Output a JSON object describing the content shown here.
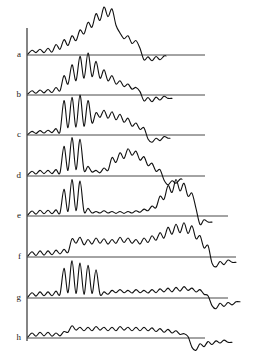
{
  "figure": {
    "kind": "stacked-spectra",
    "background_color": "#ffffff",
    "line_color": "#101010",
    "axis_color": "#333333",
    "line_width": 1.1,
    "width": 272,
    "height": 359,
    "axis": {
      "name": "vertical-axis",
      "x": 27,
      "y_top": 28,
      "y_bottom": 341
    }
  },
  "chart_data": {
    "type": "line",
    "title": "",
    "subtitle": "",
    "xlabel": "",
    "ylabel": "",
    "grid": false,
    "legend_position": "left-labels",
    "axis_ranges": {
      "x": [
        0,
        250
      ],
      "y": [
        0,
        359
      ]
    },
    "series_labels": [
      "a",
      "b",
      "c",
      "d",
      "e",
      "f",
      "g",
      "h"
    ],
    "series": [
      {
        "name": "a",
        "label": "a",
        "baseline_y": 55,
        "baseline_x_start": 27,
        "baseline_x_end": 205,
        "tail_x_end": 166,
        "amplitude_scale": 48,
        "x": [
          28,
          32,
          36,
          40,
          44,
          48,
          52,
          56,
          60,
          64,
          68,
          72,
          76,
          80,
          84,
          88,
          92,
          96,
          100,
          104,
          108,
          112,
          116,
          120,
          124,
          128,
          132,
          136,
          140,
          144,
          148,
          152,
          156,
          160,
          164
        ],
        "values": [
          0.02,
          0.1,
          0.05,
          0.12,
          0.05,
          0.14,
          0.06,
          0.22,
          0.12,
          0.32,
          0.2,
          0.4,
          0.3,
          0.52,
          0.44,
          0.68,
          0.58,
          0.86,
          0.72,
          1.0,
          0.8,
          0.96,
          0.62,
          0.46,
          0.34,
          0.4,
          0.24,
          0.3,
          0.14,
          -0.1,
          -0.04,
          -0.12,
          -0.03,
          -0.1,
          -0.02
        ]
      },
      {
        "name": "b",
        "label": "b",
        "baseline_y": 95,
        "baseline_x_start": 27,
        "baseline_x_end": 205,
        "tail_x_end": 172,
        "amplitude_scale": 42,
        "x": [
          28,
          32,
          36,
          40,
          44,
          48,
          52,
          56,
          60,
          64,
          68,
          72,
          76,
          80,
          84,
          88,
          92,
          96,
          100,
          104,
          108,
          112,
          116,
          120,
          124,
          128,
          132,
          136,
          140,
          144,
          148,
          152,
          156,
          160,
          164,
          168
        ],
        "values": [
          0.03,
          0.1,
          0.04,
          0.12,
          0.05,
          0.13,
          0.06,
          0.18,
          0.1,
          0.46,
          0.26,
          0.72,
          0.34,
          0.92,
          0.4,
          1.0,
          0.44,
          0.8,
          0.4,
          0.6,
          0.34,
          0.46,
          0.26,
          0.34,
          0.2,
          0.26,
          0.14,
          0.18,
          0.08,
          -0.14,
          -0.06,
          -0.16,
          -0.05,
          -0.12,
          -0.03,
          -0.08
        ]
      },
      {
        "name": "c",
        "label": "c",
        "baseline_y": 135,
        "baseline_x_start": 27,
        "baseline_x_end": 205,
        "tail_x_end": 170,
        "amplitude_scale": 40,
        "x": [
          28,
          32,
          36,
          40,
          44,
          48,
          52,
          56,
          60,
          64,
          68,
          72,
          76,
          80,
          84,
          88,
          92,
          96,
          100,
          104,
          108,
          112,
          116,
          120,
          124,
          128,
          132,
          136,
          140,
          144,
          148,
          152,
          156,
          160,
          164,
          168
        ],
        "values": [
          0.02,
          0.09,
          0.04,
          0.11,
          0.05,
          0.12,
          0.06,
          0.16,
          0.08,
          0.86,
          0.18,
          0.94,
          0.2,
          1.0,
          0.22,
          0.86,
          0.3,
          0.56,
          0.44,
          0.62,
          0.42,
          0.58,
          0.38,
          0.52,
          0.32,
          0.42,
          0.22,
          0.3,
          0.14,
          0.18,
          -0.1,
          -0.18,
          -0.08,
          -0.14,
          -0.04,
          -0.08
        ]
      },
      {
        "name": "d",
        "label": "d",
        "baseline_y": 176,
        "baseline_x_start": 27,
        "baseline_x_end": 205,
        "tail_x_end": 182,
        "amplitude_scale": 40,
        "x": [
          28,
          32,
          36,
          40,
          44,
          48,
          52,
          56,
          60,
          64,
          68,
          72,
          76,
          80,
          84,
          88,
          92,
          96,
          100,
          104,
          108,
          112,
          116,
          120,
          124,
          128,
          132,
          136,
          140,
          144,
          148,
          152,
          156,
          160,
          164,
          168,
          172,
          176,
          180
        ],
        "values": [
          0.03,
          0.12,
          0.05,
          0.14,
          0.06,
          0.14,
          0.06,
          0.16,
          0.08,
          0.74,
          0.14,
          0.96,
          0.16,
          0.92,
          0.14,
          0.24,
          0.1,
          0.14,
          0.08,
          0.2,
          0.14,
          0.46,
          0.34,
          0.58,
          0.44,
          0.68,
          0.52,
          0.62,
          0.4,
          0.48,
          0.26,
          0.32,
          0.12,
          0.16,
          -0.1,
          -0.22,
          -0.12,
          -0.18,
          -0.08
        ]
      },
      {
        "name": "e",
        "label": "e",
        "baseline_y": 216,
        "baseline_x_start": 27,
        "baseline_x_end": 228,
        "tail_x_end": 212,
        "amplitude_scale": 38,
        "x": [
          28,
          32,
          36,
          40,
          44,
          48,
          52,
          56,
          60,
          64,
          68,
          72,
          76,
          80,
          84,
          88,
          92,
          96,
          100,
          104,
          108,
          112,
          116,
          120,
          124,
          128,
          132,
          136,
          140,
          144,
          148,
          152,
          156,
          160,
          164,
          168,
          172,
          176,
          180,
          184,
          188,
          192,
          196,
          200,
          204,
          208
        ],
        "values": [
          0.03,
          0.13,
          0.05,
          0.15,
          0.06,
          0.15,
          0.06,
          0.16,
          0.08,
          0.7,
          0.12,
          0.96,
          0.14,
          0.92,
          0.12,
          0.2,
          0.08,
          0.12,
          0.08,
          0.14,
          0.08,
          0.12,
          0.07,
          0.12,
          0.07,
          0.12,
          0.08,
          0.14,
          0.1,
          0.18,
          0.14,
          0.26,
          0.22,
          0.52,
          0.44,
          0.8,
          0.62,
          0.96,
          0.66,
          0.86,
          0.52,
          0.6,
          0.2,
          -0.22,
          -0.1,
          -0.16
        ]
      },
      {
        "name": "f",
        "label": "f",
        "baseline_y": 257,
        "baseline_x_start": 27,
        "baseline_x_end": 236,
        "tail_x_end": 236,
        "amplitude_scale": 38,
        "x": [
          28,
          32,
          36,
          40,
          44,
          48,
          52,
          56,
          60,
          64,
          68,
          72,
          76,
          80,
          84,
          88,
          92,
          96,
          100,
          104,
          108,
          112,
          116,
          120,
          124,
          128,
          132,
          136,
          140,
          144,
          148,
          152,
          156,
          160,
          164,
          168,
          172,
          176,
          180,
          184,
          188,
          192,
          196,
          200,
          204,
          208,
          212,
          216,
          220,
          224,
          228,
          232
        ],
        "values": [
          0.03,
          0.14,
          0.04,
          0.16,
          0.05,
          0.16,
          0.06,
          0.18,
          0.08,
          0.2,
          0.12,
          0.48,
          0.36,
          0.52,
          0.32,
          0.46,
          0.34,
          0.5,
          0.36,
          0.48,
          0.34,
          0.46,
          0.36,
          0.52,
          0.38,
          0.5,
          0.36,
          0.46,
          0.34,
          0.5,
          0.38,
          0.56,
          0.44,
          0.64,
          0.5,
          0.78,
          0.6,
          0.86,
          0.64,
          0.9,
          0.62,
          0.82,
          0.48,
          0.56,
          0.24,
          0.3,
          -0.16,
          -0.26,
          -0.12,
          -0.2,
          -0.08,
          -0.14
        ]
      },
      {
        "name": "g",
        "label": "g",
        "baseline_y": 298,
        "baseline_x_start": 27,
        "baseline_x_end": 228,
        "tail_x_end": 240,
        "amplitude_scale": 38,
        "x": [
          28,
          32,
          36,
          40,
          44,
          48,
          52,
          56,
          60,
          64,
          68,
          72,
          76,
          80,
          84,
          88,
          92,
          96,
          100,
          104,
          108,
          112,
          116,
          120,
          124,
          128,
          132,
          136,
          140,
          144,
          148,
          152,
          156,
          160,
          164,
          168,
          172,
          176,
          180,
          184,
          188,
          192,
          196,
          200,
          204,
          208,
          212,
          216,
          220,
          224,
          228,
          232,
          236
        ],
        "values": [
          0.03,
          0.14,
          0.05,
          0.16,
          0.06,
          0.16,
          0.06,
          0.18,
          0.1,
          0.78,
          0.14,
          0.98,
          0.12,
          0.92,
          0.1,
          0.86,
          0.12,
          0.74,
          0.1,
          0.16,
          0.1,
          0.2,
          0.14,
          0.22,
          0.14,
          0.2,
          0.13,
          0.22,
          0.14,
          0.2,
          0.13,
          0.22,
          0.14,
          0.24,
          0.16,
          0.26,
          0.16,
          0.28,
          0.18,
          0.3,
          0.2,
          0.26,
          0.16,
          0.22,
          0.1,
          0.06,
          -0.2,
          -0.28,
          -0.14,
          -0.22,
          -0.12,
          -0.18,
          -0.1
        ]
      },
      {
        "name": "h",
        "label": "h",
        "baseline_y": 338,
        "baseline_x_start": 27,
        "baseline_x_end": 205,
        "tail_x_end": 232,
        "amplitude_scale": 36,
        "x": [
          28,
          32,
          36,
          40,
          44,
          48,
          52,
          56,
          60,
          64,
          68,
          72,
          76,
          80,
          84,
          88,
          92,
          96,
          100,
          104,
          108,
          112,
          116,
          120,
          124,
          128,
          132,
          136,
          140,
          144,
          148,
          152,
          156,
          160,
          164,
          168,
          172,
          176,
          180,
          184,
          188,
          192,
          196,
          200,
          204,
          208,
          212,
          216,
          220,
          224,
          228
        ],
        "values": [
          0.03,
          0.14,
          0.05,
          0.16,
          0.06,
          0.16,
          0.05,
          0.14,
          0.06,
          0.18,
          0.16,
          0.34,
          0.22,
          0.3,
          0.2,
          0.3,
          0.2,
          0.32,
          0.22,
          0.3,
          0.2,
          0.3,
          0.2,
          0.32,
          0.22,
          0.3,
          0.2,
          0.3,
          0.2,
          0.3,
          0.2,
          0.28,
          0.18,
          0.26,
          0.16,
          0.24,
          0.14,
          0.2,
          0.1,
          0.12,
          0.04,
          -0.26,
          -0.34,
          -0.16,
          -0.24,
          -0.1,
          -0.18,
          -0.08,
          -0.14,
          -0.06,
          -0.12
        ]
      }
    ]
  }
}
